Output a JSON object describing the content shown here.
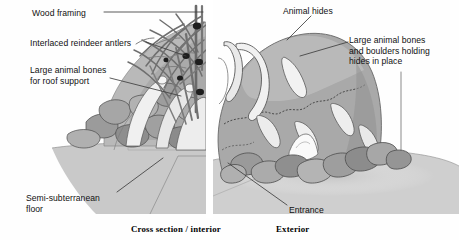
{
  "figure": {
    "background_color": "#ffffff",
    "panel_divider": {
      "x": 209,
      "color": "#ffffff",
      "width": 7
    }
  },
  "captions": [
    {
      "id": "cross-section",
      "text": "Cross section / interior",
      "x": 131,
      "y": 224
    },
    {
      "id": "exterior",
      "text": "Exterior",
      "x": 276,
      "y": 224
    }
  ],
  "labels": [
    {
      "id": "wood-framing",
      "text": "Wood framing",
      "x": 32,
      "y": 8,
      "align": "left"
    },
    {
      "id": "interlaced-reindeer-antlers",
      "text": "Interlaced reindeer antlers",
      "x": 30,
      "y": 38,
      "align": "left"
    },
    {
      "id": "large-animal-bones-roof",
      "text": "Large animal bones\nfor roof support",
      "x": 30,
      "y": 65,
      "align": "left"
    },
    {
      "id": "semi-subterranean-floor",
      "text": "Semi-subterranean\nfloor",
      "x": 26,
      "y": 193,
      "align": "left"
    },
    {
      "id": "animal-hides",
      "text": "Animal hides",
      "x": 283,
      "y": 6,
      "align": "left"
    },
    {
      "id": "large-animal-bones-boulders",
      "text": "Large animal bones\nand boulders holding\nhides in place",
      "x": 349,
      "y": 35,
      "align": "left"
    },
    {
      "id": "entrance",
      "text": "Entrance",
      "x": 289,
      "y": 205,
      "align": "left"
    }
  ],
  "leader_lines": [
    {
      "id": "leader-wood-framing",
      "points": "104,12 203,12"
    },
    {
      "id": "leader-antlers",
      "points": "146,42 186,56"
    },
    {
      "id": "leader-roof-bones",
      "points": "110,78 181,96"
    },
    {
      "id": "leader-floor",
      "points": "117,192 163,158"
    },
    {
      "id": "leader-hides",
      "points": "311,16 287,40"
    },
    {
      "id": "leader-bones-boulders",
      "points": "348,42 300,56"
    },
    {
      "id": "leader-bones-boulders-drop",
      "points": "401,72 401,150"
    },
    {
      "id": "leader-entrance",
      "points": "287,205 228,163"
    }
  ],
  "palette": {
    "ink": "#111111",
    "leader": "#444444",
    "mound_mid": "#a8a8a8",
    "mound_light": "#c4c4c4",
    "mound_dark": "#8d8d8d",
    "bone_white": "#f4f4f4",
    "bone_shadow": "#d8d8d8",
    "boulder_light": "#b5b5b5",
    "boulder_dark": "#8a8a8a",
    "ground": "#c9c9c9",
    "floor": "#bdbdbd",
    "timber": "#7c7c7c",
    "knot": "#1c1c1c",
    "outline": "#3a3a3a"
  },
  "scene": {
    "left_panel": {
      "name": "cross-section-interior",
      "elements": [
        "wood framing poles",
        "interlaced reindeer antlers",
        "large animal bones for roof support",
        "mammoth bone wall blocks",
        "semi-subterranean floor"
      ]
    },
    "right_panel": {
      "name": "exterior",
      "elements": [
        "animal hides covering dome",
        "tusk arch over entrance",
        "large animal bones and boulders at base",
        "entrance opening",
        "ground line"
      ]
    }
  }
}
